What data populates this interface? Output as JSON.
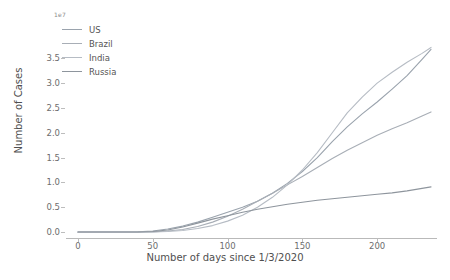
{
  "chart_data": {
    "type": "line",
    "title": "",
    "xlabel": "Number of days since 1/3/2020",
    "ylabel": "Number of Cases",
    "y_offset_text": "1e7",
    "xlim": [
      -8,
      240
    ],
    "ylim": [
      -0.12,
      3.95
    ],
    "xticks": [
      0,
      50,
      100,
      150,
      200
    ],
    "xtick_labels": [
      "0",
      "50",
      "100",
      "150",
      "200"
    ],
    "yticks": [
      0.0,
      0.5,
      1.0,
      1.5,
      2.0,
      2.5,
      3.0,
      3.5
    ],
    "ytick_labels": [
      "0.0",
      "0.5",
      "1.0",
      "1.5",
      "2.0",
      "2.5",
      "3.0",
      "3.5"
    ],
    "grid": false,
    "legend_position": "upper left",
    "x": [
      0,
      10,
      20,
      30,
      40,
      50,
      60,
      70,
      80,
      90,
      100,
      110,
      120,
      130,
      140,
      150,
      160,
      170,
      180,
      190,
      200,
      210,
      220,
      230,
      236
    ],
    "series": [
      {
        "name": "US",
        "color": "#9aa3ad",
        "values": [
          0.0,
          0.0,
          0.0,
          0.001,
          0.004,
          0.02,
          0.06,
          0.12,
          0.2,
          0.3,
          0.4,
          0.5,
          0.62,
          0.78,
          0.98,
          1.22,
          1.5,
          1.82,
          2.12,
          2.38,
          2.62,
          2.88,
          3.15,
          3.48,
          3.68
        ]
      },
      {
        "name": "Brazil",
        "color": "#a8aeb6",
        "values": [
          0.0,
          0.0,
          0.0,
          0.0,
          0.001,
          0.004,
          0.02,
          0.05,
          0.11,
          0.2,
          0.32,
          0.46,
          0.62,
          0.78,
          0.95,
          1.12,
          1.3,
          1.48,
          1.65,
          1.8,
          1.95,
          2.08,
          2.2,
          2.34,
          2.42
        ]
      },
      {
        "name": "India",
        "color": "#b6bcc4",
        "values": [
          0.0,
          0.0,
          0.0,
          0.0,
          0.001,
          0.003,
          0.01,
          0.03,
          0.07,
          0.13,
          0.22,
          0.34,
          0.5,
          0.7,
          0.95,
          1.25,
          1.6,
          2.0,
          2.4,
          2.72,
          3.0,
          3.22,
          3.42,
          3.6,
          3.72
        ]
      },
      {
        "name": "Russia",
        "color": "#8e959d",
        "values": [
          0.0,
          0.0,
          0.0,
          0.0,
          0.002,
          0.01,
          0.04,
          0.1,
          0.18,
          0.26,
          0.33,
          0.4,
          0.46,
          0.51,
          0.56,
          0.6,
          0.64,
          0.67,
          0.7,
          0.73,
          0.76,
          0.79,
          0.83,
          0.88,
          0.91
        ]
      }
    ]
  },
  "legend": {
    "items": [
      {
        "label": "US"
      },
      {
        "label": "Brazil"
      },
      {
        "label": "India"
      },
      {
        "label": "Russia"
      }
    ]
  }
}
